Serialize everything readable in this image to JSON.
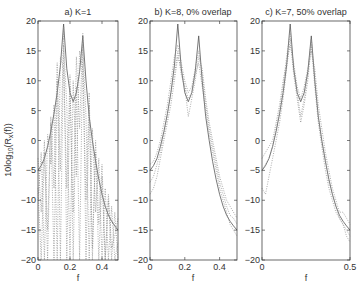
{
  "figure": {
    "ylabel": "10log10(Rx(f))",
    "ylabel_main": "10log",
    "ylabel_sub1": "10",
    "ylabel_mid": "(R",
    "ylabel_sub2": "x",
    "ylabel_end": "(f))"
  },
  "chart_data": [
    {
      "type": "line",
      "title": "a) K=1",
      "xlabel": "f",
      "ylabel": "10log10(Rx(f))",
      "xlim": [
        0,
        0.5
      ],
      "ylim": [
        -20,
        20
      ],
      "xticks": [
        0,
        0.2,
        0.4
      ],
      "xtick_labels": [
        "0",
        "0.2",
        "0.4"
      ],
      "yticks": [
        20,
        15,
        10,
        5,
        0,
        -5,
        -10,
        -15,
        -20
      ],
      "ytick_labels": [
        "20",
        "15",
        "10",
        "5",
        "0",
        "-5",
        "-10",
        "-15",
        "-20"
      ],
      "box": {
        "x0": 38,
        "x1": 118,
        "y0": 21,
        "y1": 260
      },
      "x": [
        0,
        0.02,
        0.04,
        0.06,
        0.08,
        0.1,
        0.12,
        0.14,
        0.16,
        0.18,
        0.2,
        0.22,
        0.24,
        0.26,
        0.28,
        0.3,
        0.32,
        0.34,
        0.36,
        0.38,
        0.4,
        0.42,
        0.44,
        0.46,
        0.48,
        0.5
      ],
      "series": [
        {
          "name": "true spectrum",
          "style": "solid",
          "values": [
            -5,
            -4.2,
            -3,
            -1,
            1.5,
            4.5,
            8,
            12.5,
            19.5,
            12,
            8,
            6.5,
            8,
            11.5,
            17.5,
            10,
            4,
            0,
            -3.5,
            -6.5,
            -9,
            -11,
            -12.5,
            -13.5,
            -14.3,
            -15
          ]
        },
        {
          "name": "estimate 1",
          "style": "dotted",
          "values": [
            -8,
            -20,
            -2,
            -15,
            3,
            -20,
            10,
            -5,
            19,
            -20,
            9,
            -12,
            14,
            2,
            18,
            -20,
            6,
            -18,
            -2,
            -20,
            -6,
            -20,
            -10,
            -20,
            -12,
            -20
          ]
        },
        {
          "name": "estimate 2",
          "style": "dotted",
          "values": [
            -3,
            -12,
            0,
            -20,
            4,
            -8,
            13,
            -20,
            16,
            6,
            -20,
            10,
            -6,
            15,
            12,
            -10,
            8,
            -20,
            0,
            -14,
            -4,
            -20,
            -9,
            -18,
            -16,
            -13
          ]
        },
        {
          "name": "estimate 3",
          "style": "dotted",
          "values": [
            -10,
            -2,
            -20,
            1,
            -4,
            6,
            -20,
            14,
            12,
            -8,
            11,
            -20,
            9,
            -20,
            16,
            4,
            -20,
            2,
            -12,
            -3,
            -20,
            -8,
            -20,
            -11,
            -20,
            -17
          ]
        }
      ]
    },
    {
      "type": "line",
      "title": "b) K=8, 0% overlap",
      "xlabel": "f",
      "xlim": [
        0,
        0.5
      ],
      "ylim": [
        -20,
        20
      ],
      "xticks": [
        0,
        0.2,
        0.4
      ],
      "xtick_labels": [
        "0",
        "0.2",
        "0.4"
      ],
      "yticks": [
        20,
        15,
        10,
        5,
        0,
        -5,
        -10,
        -15,
        -20
      ],
      "ytick_labels": [
        "20",
        "15",
        "10",
        "5",
        "0",
        "-5",
        "-10",
        "-15",
        "-20"
      ],
      "box": {
        "x0": 150,
        "x1": 237,
        "y0": 21,
        "y1": 260
      },
      "x": [
        0,
        0.02,
        0.04,
        0.06,
        0.08,
        0.1,
        0.12,
        0.14,
        0.16,
        0.18,
        0.2,
        0.22,
        0.24,
        0.26,
        0.28,
        0.3,
        0.32,
        0.34,
        0.36,
        0.38,
        0.4,
        0.42,
        0.44,
        0.46,
        0.48,
        0.5
      ],
      "series": [
        {
          "name": "true spectrum",
          "style": "solid",
          "values": [
            -5,
            -4.2,
            -3,
            -1,
            1.5,
            4.5,
            8,
            12.5,
            19.5,
            12,
            8,
            6.5,
            8,
            11.5,
            17.5,
            10,
            4,
            0,
            -3.5,
            -6.5,
            -9,
            -11,
            -12.5,
            -13.5,
            -14.3,
            -15
          ]
        },
        {
          "name": "estimate 1",
          "style": "dotted",
          "values": [
            -4,
            -3.5,
            -2,
            0,
            3,
            6,
            10,
            14,
            16,
            13,
            10,
            8,
            9,
            12,
            15,
            11,
            6,
            2,
            -1,
            -4,
            -7,
            -9,
            -11,
            -12.5,
            -13,
            -14
          ]
        },
        {
          "name": "estimate 2",
          "style": "dotted",
          "values": [
            -7,
            -6,
            -4,
            -2,
            1,
            4,
            8,
            11,
            15,
            11,
            9,
            4,
            7,
            10,
            14,
            12,
            7,
            3,
            0,
            -3,
            -6,
            -8,
            -10,
            -11,
            -12,
            -13
          ]
        },
        {
          "name": "estimate 3",
          "style": "dotted",
          "values": [
            -9,
            -8,
            -6,
            -3,
            0,
            3,
            6,
            10,
            14,
            12,
            9,
            7,
            8,
            11,
            13,
            9,
            5,
            1,
            -2,
            -5,
            -8,
            -10,
            -12,
            -14,
            -15,
            -16
          ]
        }
      ]
    },
    {
      "type": "line",
      "title": "c) K=7, 50% overlap",
      "xlabel": "f",
      "xlim": [
        0,
        0.5
      ],
      "ylim": [
        -20,
        20
      ],
      "xticks": [
        0,
        0.5
      ],
      "xtick_labels": [
        "0",
        "0.5"
      ],
      "yticks": [
        20,
        15,
        10,
        5,
        0,
        -5,
        -10,
        -15,
        -20
      ],
      "ytick_labels": [
        "20",
        "15",
        "10",
        "5",
        "0",
        "-5",
        "-10",
        "-15",
        "-20"
      ],
      "box": {
        "x0": 262,
        "x1": 350,
        "y0": 21,
        "y1": 260
      },
      "x": [
        0,
        0.02,
        0.04,
        0.06,
        0.08,
        0.1,
        0.12,
        0.14,
        0.16,
        0.18,
        0.2,
        0.22,
        0.24,
        0.26,
        0.28,
        0.3,
        0.32,
        0.34,
        0.36,
        0.38,
        0.4,
        0.42,
        0.44,
        0.46,
        0.48,
        0.5
      ],
      "series": [
        {
          "name": "true spectrum",
          "style": "solid",
          "values": [
            -5,
            -4.2,
            -3,
            -1,
            1.5,
            4.5,
            8,
            12.5,
            19.5,
            12,
            8,
            6.5,
            8,
            11.5,
            17.5,
            10,
            4,
            0,
            -3.5,
            -6.5,
            -9,
            -11,
            -12.5,
            -13.5,
            -14.3,
            -15
          ]
        },
        {
          "name": "estimate 1",
          "style": "dotted",
          "values": [
            -5,
            -4,
            -3,
            -1,
            2,
            5,
            9,
            14,
            18,
            12,
            8,
            4,
            7,
            11,
            17,
            10,
            4,
            0,
            -3,
            -7,
            -9,
            -11,
            -13,
            -14,
            -15,
            -16
          ]
        },
        {
          "name": "estimate 2",
          "style": "dotted",
          "values": [
            -8,
            -9,
            -6,
            -3,
            0,
            3,
            7,
            12,
            17,
            11,
            7,
            3,
            6,
            10,
            16,
            9,
            3,
            -1,
            -5,
            -8,
            -10,
            -12,
            -13,
            -14,
            -16,
            -17
          ]
        },
        {
          "name": "estimate 3",
          "style": "dotted",
          "values": [
            -3,
            -2,
            -1,
            0,
            3,
            6,
            10,
            13,
            16,
            13,
            9,
            7,
            9,
            12,
            15,
            12,
            6,
            2,
            -2,
            -5,
            -8,
            -10,
            -12,
            -12,
            -13,
            -14
          ]
        }
      ]
    }
  ]
}
